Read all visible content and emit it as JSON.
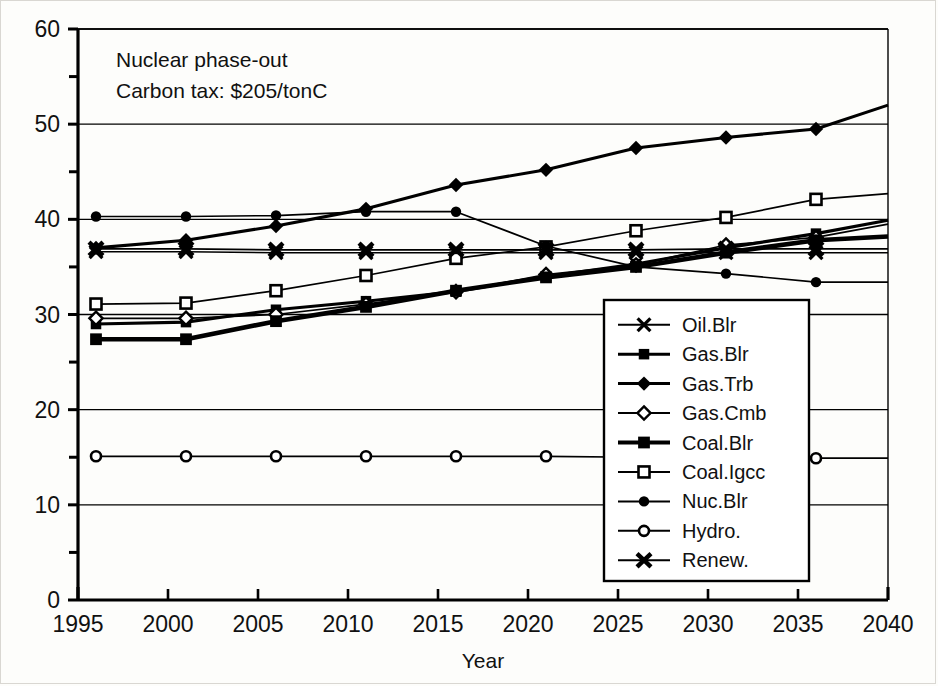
{
  "annotation": {
    "line1": "Nuclear phase-out",
    "line2": "Carbon tax:  $205/tonC"
  },
  "axes": {
    "x_title": "Year",
    "x_ticks": [
      "1995",
      "2000",
      "2005",
      "2010",
      "2015",
      "2020",
      "2025",
      "2030",
      "2035",
      "2040"
    ],
    "y_ticks": [
      "0",
      "10",
      "20",
      "30",
      "40",
      "50",
      "60"
    ]
  },
  "legend": {
    "items": [
      {
        "label": "Oil.Blr",
        "marker": "cross-x-marker"
      },
      {
        "label": "Gas.Blr",
        "marker": "filled-square-marker"
      },
      {
        "label": "Gas.Trb",
        "marker": "filled-diamond-marker"
      },
      {
        "label": "Gas.Cmb",
        "marker": "open-diamond-marker"
      },
      {
        "label": "Coal.Blr",
        "marker": "filled-square-bold-marker"
      },
      {
        "label": "Coal.Igcc",
        "marker": "open-square-marker"
      },
      {
        "label": "Nuc.Blr",
        "marker": "filled-circle-marker"
      },
      {
        "label": "Hydro.",
        "marker": "open-circle-marker"
      },
      {
        "label": "Renew.",
        "marker": "bold-cross-x-marker"
      }
    ]
  },
  "chart_data": {
    "type": "line",
    "title": "",
    "subtitle": "",
    "xlabel": "Year",
    "ylabel": "",
    "xlim": [
      1995,
      2040
    ],
    "ylim": [
      0,
      60
    ],
    "xticks": [
      1995,
      2000,
      2005,
      2010,
      2015,
      2020,
      2025,
      2030,
      2035,
      2040
    ],
    "yticks": [
      0,
      10,
      20,
      30,
      40,
      50,
      60
    ],
    "grid": "horizontal-major",
    "legend_position": "inside-lower-right",
    "annotations": [
      "Nuclear phase-out",
      "Carbon tax:  $205/tonC"
    ],
    "x": [
      1996,
      2001,
      2006,
      2011,
      2016,
      2021,
      2026,
      2031,
      2036,
      2040
    ],
    "series": [
      {
        "name": "Oil.Blr",
        "marker": "x",
        "values": [
          36.6,
          36.6,
          36.5,
          36.5,
          36.5,
          36.5,
          36.5,
          36.5,
          36.5,
          36.5
        ]
      },
      {
        "name": "Gas.Blr",
        "marker": "filled-square",
        "values": [
          29.0,
          29.2,
          30.5,
          31.4,
          32.4,
          34.0,
          35.3,
          37.0,
          38.5,
          39.9
        ]
      },
      {
        "name": "Gas.Trb",
        "marker": "filled-diamond",
        "values": [
          37.0,
          37.8,
          39.3,
          41.1,
          43.6,
          45.2,
          47.5,
          48.6,
          49.5,
          52.0
        ]
      },
      {
        "name": "Gas.Cmb",
        "marker": "open-diamond",
        "values": [
          29.6,
          29.6,
          30.0,
          31.1,
          32.4,
          34.2,
          35.2,
          37.3,
          38.1,
          39.5
        ]
      },
      {
        "name": "Coal.Blr",
        "marker": "filled-square",
        "values": [
          27.4,
          27.4,
          29.3,
          30.8,
          32.5,
          33.9,
          35.0,
          36.5,
          37.8,
          38.2
        ]
      },
      {
        "name": "Coal.Igcc",
        "marker": "open-square",
        "values": [
          31.1,
          31.2,
          32.5,
          34.1,
          35.9,
          37.1,
          38.8,
          40.2,
          42.1,
          42.7
        ]
      },
      {
        "name": "Nuc.Blr",
        "marker": "filled-circle",
        "values": [
          40.3,
          40.3,
          40.4,
          40.8,
          40.8,
          37.2,
          35.0,
          34.3,
          33.4,
          33.4
        ]
      },
      {
        "name": "Hydro.",
        "marker": "open-circle",
        "values": [
          15.1,
          15.1,
          15.1,
          15.1,
          15.1,
          15.1,
          15.0,
          15.0,
          14.9,
          14.9
        ]
      },
      {
        "name": "Renew.",
        "marker": "bold-x",
        "values": [
          36.9,
          36.9,
          36.8,
          36.8,
          36.8,
          36.8,
          36.8,
          36.9,
          36.9,
          36.9
        ]
      }
    ]
  }
}
